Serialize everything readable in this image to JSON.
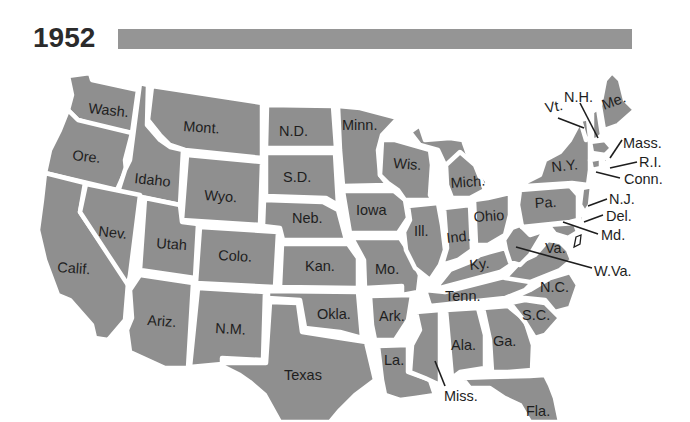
{
  "header": {
    "year": "1952",
    "bar_color": "#959595"
  },
  "colors": {
    "state_fill": "#8f8f8f",
    "border": "#ffffff",
    "label": "#1e1e1e",
    "background": "#ffffff"
  },
  "states": {
    "wa": "Wash.",
    "or": "Ore.",
    "ca": "Calif.",
    "id": "Idaho",
    "nv": "Nev.",
    "mt": "Mont.",
    "wy": "Wyo.",
    "ut": "Utah",
    "az": "Ariz.",
    "co": "Colo.",
    "nm": "N.M.",
    "nd": "N.D.",
    "sd": "S.D.",
    "ne": "Neb.",
    "ks": "Kan.",
    "ok": "Okla.",
    "tx": "Texas",
    "mn": "Minn.",
    "ia": "Iowa",
    "mo": "Mo.",
    "ar": "Ark.",
    "la": "La.",
    "wi": "Wis.",
    "il": "Ill.",
    "mi": "Mich.",
    "in": "Ind.",
    "oh": "Ohio",
    "ky": "Ky.",
    "tn": "Tenn.",
    "ms": "Miss.",
    "al": "Ala.",
    "ga": "Ga.",
    "fl": "Fla.",
    "sc": "S.C.",
    "nc": "N.C.",
    "va": "Va.",
    "wv": "W.Va.",
    "pa": "Pa.",
    "ny": "N.Y.",
    "vt": "Vt.",
    "nh": "N.H.",
    "me": "Me.",
    "ma": "Mass.",
    "ri": "R.I.",
    "ct": "Conn.",
    "nj": "N.J.",
    "de": "Del.",
    "md": "Md."
  }
}
